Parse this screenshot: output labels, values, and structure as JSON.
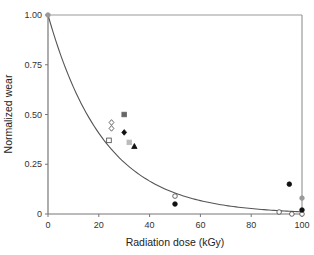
{
  "chart_data": {
    "type": "scatter",
    "title": "",
    "xlabel": "Radiation dose (kGy)",
    "ylabel": "Normalized wear",
    "xlim": [
      0,
      100
    ],
    "ylim": [
      0,
      1.0
    ],
    "xticks": [
      0,
      20,
      40,
      60,
      80,
      100
    ],
    "xtick_labels": [
      "0",
      "20",
      "40",
      "60",
      "80",
      "100"
    ],
    "yticks": [
      0,
      0.25,
      0.5,
      0.75,
      1.0
    ],
    "ytick_labels": [
      "0",
      "0.25",
      "0.50",
      "0.75",
      "1.00"
    ],
    "grid": false,
    "legend": "none",
    "fit_curve": {
      "name": "exponential-fit",
      "equation": "y = exp(-0.045 x)",
      "color": "#555555"
    },
    "series": [
      {
        "name": "gray-circle",
        "marker": "circle",
        "fill": "#999999",
        "stroke": "#999999",
        "points": [
          [
            0,
            1.0
          ],
          [
            100,
            0.08
          ]
        ]
      },
      {
        "name": "open-diamond",
        "marker": "diamond",
        "fill": "#ffffff",
        "stroke": "#444444",
        "points": [
          [
            25,
            0.46
          ],
          [
            25,
            0.43
          ]
        ]
      },
      {
        "name": "open-square",
        "marker": "square",
        "fill": "#ffffff",
        "stroke": "#444444",
        "points": [
          [
            24,
            0.37
          ]
        ]
      },
      {
        "name": "dark-gray-square",
        "marker": "square",
        "fill": "#666666",
        "stroke": "#666666",
        "points": [
          [
            30,
            0.5
          ]
        ]
      },
      {
        "name": "black-diamond",
        "marker": "diamond",
        "fill": "#111111",
        "stroke": "#111111",
        "points": [
          [
            30,
            0.41
          ]
        ]
      },
      {
        "name": "light-gray-square",
        "marker": "square",
        "fill": "#bbbbbb",
        "stroke": "#bbbbbb",
        "points": [
          [
            32,
            0.36
          ]
        ]
      },
      {
        "name": "black-triangle",
        "marker": "triangle",
        "fill": "#111111",
        "stroke": "#111111",
        "points": [
          [
            34,
            0.34
          ]
        ]
      },
      {
        "name": "open-circle",
        "marker": "circle",
        "fill": "#ffffff",
        "stroke": "#444444",
        "points": [
          [
            50,
            0.09
          ],
          [
            91,
            0.01
          ],
          [
            96,
            0.0
          ],
          [
            100,
            0.0
          ]
        ]
      },
      {
        "name": "black-circle",
        "marker": "circle",
        "fill": "#111111",
        "stroke": "#111111",
        "points": [
          [
            50,
            0.05
          ],
          [
            95,
            0.15
          ],
          [
            100,
            0.02
          ]
        ]
      }
    ]
  }
}
